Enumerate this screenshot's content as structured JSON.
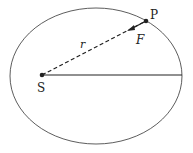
{
  "diagram": {
    "type": "orbit-ellipse",
    "labels": {
      "focus": "S",
      "point": "P",
      "radius": "r",
      "force": "F"
    },
    "colors": {
      "stroke": "#222222",
      "background": "#ffffff"
    }
  }
}
